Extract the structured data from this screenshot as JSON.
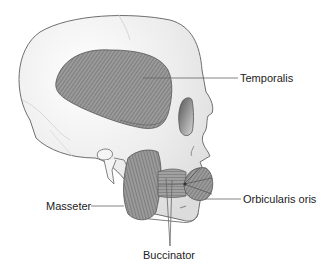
{
  "diagram": {
    "labels": {
      "temporalis": "Temporalis",
      "masseter": "Masseter",
      "orbicularis_oris": "Orbicularis oris",
      "buccinator": "Buccinator"
    },
    "colors": {
      "background": "#ffffff",
      "bone": "#efefef",
      "bone_outline": "#6f6f6f",
      "muscle": "#8a8a8a",
      "muscle_dark": "#5e5e5e",
      "leader_line": "#666666",
      "label_text": "#222222"
    }
  }
}
